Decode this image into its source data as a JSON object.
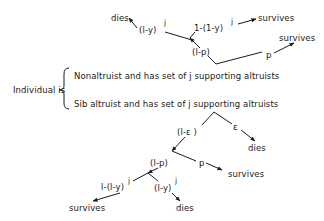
{
  "top_tree": {
    "dies": "dies",
    "fail_prob": "(l-y)",
    "fail_exp": "j",
    "success_prob": "1-(1-y)",
    "success_exp": "j",
    "survives_1": "survives",
    "not_p": "(l-p)",
    "p": "p",
    "survives_2": "survives"
  },
  "classification": {
    "label": "Individual is",
    "option_1": "Nonaltruist and has set of j supporting altruists",
    "option_2": "Sib altruist and has set of j supporting altruists"
  },
  "bottom_tree": {
    "not_eps": "(l-ε )",
    "eps": "ε",
    "dies_eps": "dies",
    "not_p": "(l-p)",
    "p": "p",
    "survives_p": "survives",
    "success_prob": "l-(l-y)",
    "success_exp": "j",
    "fail_prob": "(l-y)",
    "fail_exp": "j",
    "survives": "survives",
    "dies": "dies"
  },
  "colors": {
    "ink": "#1a1a1a",
    "background": "#ffffff"
  }
}
